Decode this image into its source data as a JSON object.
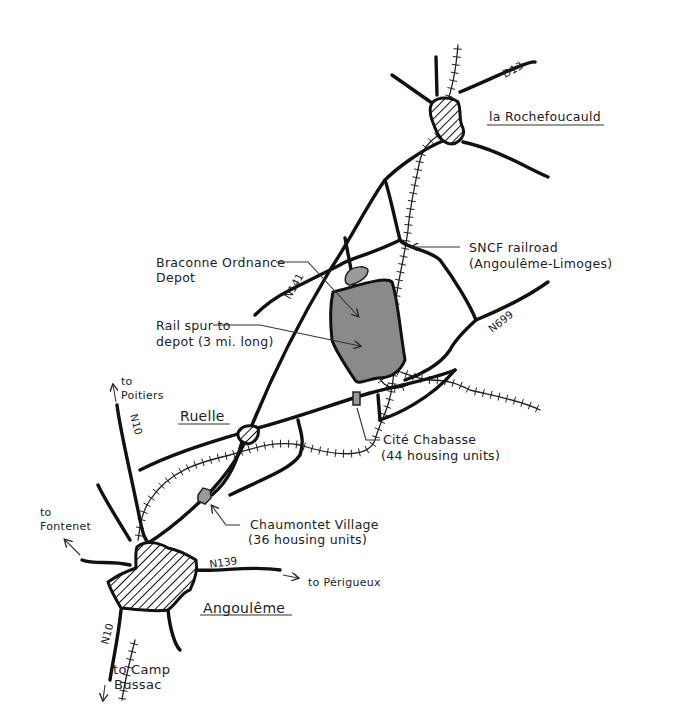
{
  "map": {
    "towns": {
      "la_rochefoucauld": "la Rochefoucauld",
      "ruelle": "Ruelle",
      "angouleme": "Angoulême"
    },
    "roads": {
      "d13": "D13",
      "n141": "N141",
      "n699": "N699",
      "n10_north": "N10",
      "n10_south": "N10",
      "n139": "N139"
    },
    "labels": {
      "sncf_line1": "SNCF railroad",
      "sncf_line2": "(Angoulême-Limoges)",
      "braconne_line1": "Braconne Ordnance",
      "braconne_line2": "Depot",
      "spur_line1": "Rail spur to",
      "spur_line2": "depot (3 mi. long)",
      "cite_line1": "Cité Chabasse",
      "cite_line2": "(44 housing units)",
      "chaumontet_line1": "Chaumontet Village",
      "chaumontet_line2": "(36 housing units)"
    },
    "directions": {
      "poitiers_line1": "to",
      "poitiers_line2": "Poitiers",
      "fontenet_line1": "to",
      "fontenet_line2": "Fontenet",
      "perigueux": "to Périgueux",
      "bussac_line1": "to Camp",
      "bussac_line2": "Bussac"
    },
    "colors": {
      "ink": "#111111",
      "depot_fill": "#8a8a8a",
      "background": "#ffffff"
    }
  }
}
